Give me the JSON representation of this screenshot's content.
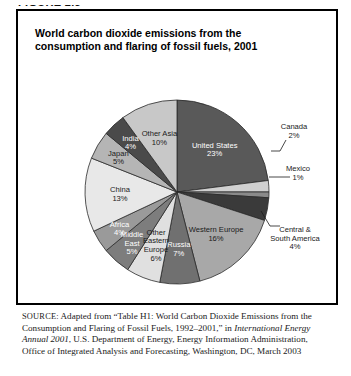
{
  "figure_label": "FIGURE 2.5",
  "chart_title": "World carbon dioxide emissions from the consumption and flaring of fossil fuels, 2001",
  "source": {
    "prefix": "SOURCE:",
    "part1": " Adapted from “Table H1: World Carbon Dioxide Emissions from the Consumption and Flaring of Fossil Fuels, 1992–2001,” in ",
    "italic": "International Energy Annual 2001",
    "part2": ", U.S. Department of Energy, Energy Information Administration, Office of Integrated Analysis and Forecasting, Washington, DC, March 2003"
  },
  "chart_data": {
    "type": "pie",
    "title": "World carbon dioxide emissions from the consumption and flaring of fossil fuels, 2001",
    "unit": "percent",
    "legend": "none (labels on/around slices)",
    "start_angle_deg": -90,
    "direction": "clockwise",
    "categories": [
      "United States",
      "Canada",
      "Mexico",
      "Central & South America",
      "Western Europe",
      "Russia",
      "Other Eastern Europe",
      "Middle East",
      "Africa",
      "China",
      "Japan",
      "India",
      "Other Asia"
    ],
    "values": [
      23,
      2,
      1,
      4,
      16,
      7,
      6,
      5,
      4,
      13,
      5,
      4,
      10
    ],
    "total": 100,
    "slices": [
      {
        "label": "United States",
        "value": 23,
        "display": "23%",
        "color": "#595959",
        "text_color": "#ffffff",
        "label_pos": "inside",
        "lines": [
          "United States",
          "23%"
        ]
      },
      {
        "label": "Canada",
        "value": 2,
        "display": "2%",
        "color": "#d0d0d0",
        "text_color": "#1a1a1a",
        "label_pos": "outside",
        "lines": [
          "Canada",
          "2%"
        ]
      },
      {
        "label": "Mexico",
        "value": 1,
        "display": "1%",
        "color": "#8a8a8a",
        "text_color": "#1a1a1a",
        "label_pos": "outside",
        "lines": [
          "Mexico",
          "1%"
        ]
      },
      {
        "label": "Central & South America",
        "value": 4,
        "display": "4%",
        "color": "#3a3a3a",
        "text_color": "#1a1a1a",
        "label_pos": "outside",
        "lines": [
          "Central &",
          "South America",
          "4%"
        ]
      },
      {
        "label": "Western Europe",
        "value": 16,
        "display": "16%",
        "color": "#a8a8a8",
        "text_color": "#1a1a1a",
        "label_pos": "inside",
        "lines": [
          "Western Europe",
          "16%"
        ]
      },
      {
        "label": "Russia",
        "value": 7,
        "display": "7%",
        "color": "#707070",
        "text_color": "#ffffff",
        "label_pos": "inside",
        "lines": [
          "Russia",
          "7%"
        ]
      },
      {
        "label": "Other Eastern Europe",
        "value": 6,
        "display": "6%",
        "color": "#e0e0e0",
        "text_color": "#1a1a1a",
        "label_pos": "inside",
        "lines": [
          "Other",
          "Eastern",
          "Europe",
          "6%"
        ]
      },
      {
        "label": "Middle East",
        "value": 5,
        "display": "5%",
        "color": "#7d7d7d",
        "text_color": "#ffffff",
        "label_pos": "inside",
        "lines": [
          "Middle",
          "East",
          "5%"
        ]
      },
      {
        "label": "Africa",
        "value": 4,
        "display": "4%",
        "color": "#9a9a9a",
        "text_color": "#ffffff",
        "label_pos": "inside",
        "lines": [
          "Africa",
          "4%"
        ]
      },
      {
        "label": "China",
        "value": 13,
        "display": "13%",
        "color": "#e8e8e8",
        "text_color": "#1a1a1a",
        "label_pos": "inside",
        "lines": [
          "China",
          "13%"
        ]
      },
      {
        "label": "Japan",
        "value": 5,
        "display": "5%",
        "color": "#b5b5b5",
        "text_color": "#1a1a1a",
        "label_pos": "inside",
        "lines": [
          "Japan",
          "5%"
        ]
      },
      {
        "label": "India",
        "value": 4,
        "display": "4%",
        "color": "#4a4a4a",
        "text_color": "#ffffff",
        "label_pos": "inside",
        "lines": [
          "India",
          "4%"
        ]
      },
      {
        "label": "Other Asia",
        "value": 10,
        "display": "10%",
        "color": "#c8c8c8",
        "text_color": "#1a1a1a",
        "label_pos": "inside",
        "lines": [
          "Other Asia",
          "10%"
        ]
      }
    ]
  }
}
